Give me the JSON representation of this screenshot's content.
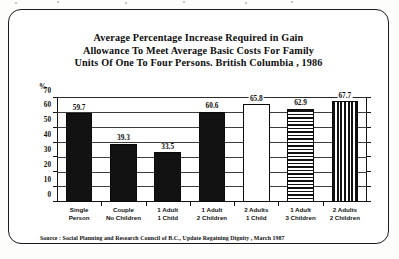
{
  "chart_data": {
    "type": "bar",
    "title": "Average Percentage Increase Required in Gain Allowance To Meet Average Basic Costs For Family Units Of One To Four Persons. British Columbia , 1986",
    "title_lines": [
      "Average Percentage Increase Required in Gain",
      "Allowance To Meet Average Basic Costs For Family",
      "Units Of One To Four Persons. British Columbia , 1986"
    ],
    "xlabel": "",
    "ylabel": "%",
    "ylim": [
      0,
      70
    ],
    "yticks": [
      0,
      10,
      20,
      30,
      40,
      50,
      60,
      70
    ],
    "ytick_labels": [
      "0",
      "10",
      "20",
      "30",
      "40",
      "50",
      "60",
      "70"
    ],
    "grid": true,
    "legend": "none",
    "categories": [
      "Single Person",
      "Couple No Children",
      "1 Adult 1 Child",
      "1 Adult 2 Children",
      "2 Adults 1 Child",
      "1 Adult 3 Children",
      "2 Adults 2 Children"
    ],
    "category_lines": [
      [
        "Single",
        "Person"
      ],
      [
        "Couple",
        "No Children"
      ],
      [
        "1 Adult",
        "1 Child"
      ],
      [
        "1 Adult",
        "2 Children"
      ],
      [
        "2 Adults",
        "1 Child"
      ],
      [
        "1 Adult",
        "3 Children"
      ],
      [
        "2 Adults",
        "2 Children"
      ]
    ],
    "values": [
      59.7,
      39.3,
      33.5,
      60.6,
      65.8,
      62.9,
      67.7
    ],
    "value_labels": [
      "59.7",
      "39.3",
      "33.5",
      "60.6",
      "65.8",
      "62.9",
      "67.7"
    ],
    "bar_patterns": [
      "solid",
      "solid",
      "solid",
      "solid",
      "hollow",
      "horizontal-stripes",
      "vertical-stripes"
    ],
    "source": "Source : Social Planning and Research Council of B.C., Update Regaining Dignity , March 1987",
    "colors": {
      "ink": "#121212",
      "paper": "#ffffff",
      "axis": "#141414",
      "grid": "#2b2b2b"
    }
  }
}
